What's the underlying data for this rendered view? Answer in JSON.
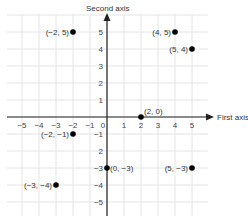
{
  "axes": {
    "x_label": "First axis",
    "y_label": "Second axis",
    "x_ticks": [
      "-5",
      "-4",
      "-3",
      "-2",
      "-1",
      "0",
      "1",
      "2",
      "3",
      "4",
      "5"
    ],
    "y_ticks": [
      "5",
      "4",
      "3",
      "2",
      "1",
      "-1",
      "2",
      "-3",
      "-4",
      "-5"
    ]
  },
  "points": [
    {
      "x": -2,
      "y": 5,
      "label": "(−2, 5)"
    },
    {
      "x": 4,
      "y": 5,
      "label": "(4, 5)"
    },
    {
      "x": 5,
      "y": 4,
      "label": "(5, 4)"
    },
    {
      "x": 2,
      "y": 0,
      "label": "(2, 0)"
    },
    {
      "x": -2,
      "y": -1,
      "label": "(−2, −1)"
    },
    {
      "x": 0,
      "y": -3,
      "label": "(0, −3)"
    },
    {
      "x": 5,
      "y": -3,
      "label": "(5, −3)"
    },
    {
      "x": -3,
      "y": -4,
      "label": "(−3, −4)"
    }
  ],
  "colors": {
    "grid": "#e4e4e4",
    "axis": "#222222",
    "point": "#000000"
  }
}
